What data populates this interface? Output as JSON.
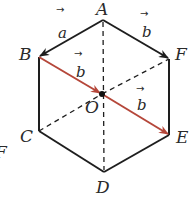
{
  "figure": {
    "type": "regular-hexagon",
    "vertices": {
      "A": {
        "label": "A",
        "x": 103,
        "y": 20
      },
      "B": {
        "label": "B",
        "x": 39,
        "y": 57
      },
      "C": {
        "label": "C",
        "x": 39,
        "y": 131
      },
      "D": {
        "label": "D",
        "x": 104,
        "y": 172
      },
      "E": {
        "label": "E",
        "x": 169,
        "y": 135
      },
      "F": {
        "label": "F",
        "x": 169,
        "y": 59
      }
    },
    "center": {
      "label": "O",
      "x": 102,
      "y": 94
    },
    "vectors": [
      {
        "from": "A",
        "to": "B",
        "label": "a",
        "arrow": "→"
      },
      {
        "from": "A",
        "to": "F",
        "label": "b",
        "arrow": "→"
      },
      {
        "from": "B",
        "to": "O",
        "label": "b",
        "arrow": "→",
        "color": "#b5473a"
      },
      {
        "from": "O",
        "to": "E",
        "label": "b",
        "arrow": "→",
        "color": "#b5473a"
      }
    ],
    "dashed_segments": [
      [
        "A",
        "O"
      ],
      [
        "O",
        "D"
      ],
      [
        "C",
        "O"
      ],
      [
        "O",
        "F"
      ]
    ],
    "edge_label_cropped": "F",
    "colors": {
      "edge": "#1e1e1e",
      "highlight": "#b5473a"
    }
  }
}
